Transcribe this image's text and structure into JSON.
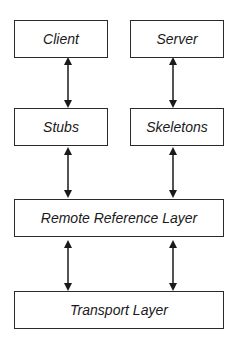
{
  "diagram": {
    "type": "layered-architecture",
    "nodes": {
      "client": "Client",
      "server": "Server",
      "stubs": "Stubs",
      "skeletons": "Skeletons",
      "remote_reference_layer": "Remote Reference Layer",
      "transport_layer": "Transport Layer"
    },
    "edges": [
      {
        "from": "Client",
        "to": "Stubs",
        "style": "bidirectional"
      },
      {
        "from": "Server",
        "to": "Skeletons",
        "style": "bidirectional"
      },
      {
        "from": "Stubs",
        "to": "Remote Reference Layer",
        "style": "bidirectional"
      },
      {
        "from": "Skeletons",
        "to": "Remote Reference Layer",
        "style": "bidirectional"
      },
      {
        "from": "Remote Reference Layer",
        "to": "Transport Layer",
        "style": "bidirectional"
      },
      {
        "from": "Remote Reference Layer",
        "to": "Transport Layer",
        "style": "bidirectional"
      }
    ],
    "colors": {
      "stroke": "#2a2a2a",
      "background": "#ffffff",
      "text": "#1a1a1a"
    }
  }
}
